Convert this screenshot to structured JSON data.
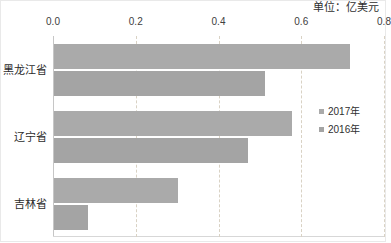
{
  "chart_data": {
    "type": "bar",
    "orientation": "horizontal",
    "title": "",
    "unit_label": "单位：亿美元",
    "xlabel": "",
    "ylabel": "",
    "categories": [
      "黑龙江省",
      "辽宁省",
      "吉林省"
    ],
    "series": [
      {
        "name": "2017年",
        "values": [
          0.715,
          0.575,
          0.3
        ],
        "color": "#aaaaaa"
      },
      {
        "name": "2016年",
        "values": [
          0.51,
          0.468,
          0.082
        ],
        "color": "#a4a4a4"
      }
    ],
    "xlim": [
      0.0,
      0.8
    ],
    "xticks": [
      0.0,
      0.2,
      0.4,
      0.6,
      0.8
    ],
    "xtick_labels": [
      "0.0",
      "0.2",
      "0.4",
      "0.6",
      "0.8"
    ],
    "grid": true,
    "grid_axis": "x",
    "legend_position": "right"
  },
  "legend": {
    "items": [
      {
        "label": "2017年",
        "color": "#aaaaaa"
      },
      {
        "label": "2016年",
        "color": "#a4a4a4"
      }
    ]
  }
}
